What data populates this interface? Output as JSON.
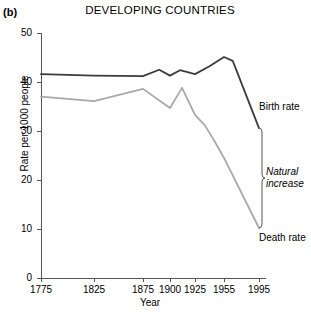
{
  "panel": {
    "label": "(b)"
  },
  "colors": {
    "birth_rate": "#3c3c3c",
    "death_rate": "#a9a9a9",
    "axis": "#555555",
    "text": "#000000",
    "background": "#ffffff"
  },
  "annotations": {
    "birth_rate_label": "Birth rate",
    "natural_increase_label_line1": "Natural",
    "natural_increase_label_line2": "increase",
    "death_rate_label": "Death rate"
  },
  "chart_data": {
    "type": "line",
    "title": "DEVELOPING COUNTRIES",
    "xlabel": "Year",
    "ylabel": "Rate per 1000 people",
    "xlim": [
      1775,
      1995
    ],
    "ylim": [
      0,
      50
    ],
    "yticks": [
      0,
      10,
      20,
      30,
      40,
      50
    ],
    "ytick_labels": [
      "0",
      "10",
      "20",
      "30",
      "40",
      "50"
    ],
    "xticks": [
      1775,
      1825,
      1875,
      1900,
      1925,
      1955,
      1995
    ],
    "xtick_labels": [
      "1775",
      "1825",
      "1875",
      "1900",
      "1925",
      "1955",
      "1995"
    ],
    "grid": false,
    "legend_position": "right-inline",
    "series": [
      {
        "name": "Birth rate",
        "color": "#3c3c3c",
        "x": [
          1775,
          1825,
          1875,
          1890,
          1900,
          1910,
          1925,
          1940,
          1955,
          1965,
          1995
        ],
        "values": [
          41.6,
          41.3,
          41.2,
          42.5,
          41.3,
          42.4,
          41.6,
          43.2,
          45.1,
          44.3,
          30.6
        ]
      },
      {
        "name": "Death rate",
        "color": "#a9a9a9",
        "x": [
          1775,
          1825,
          1875,
          1900,
          1912,
          1925,
          1935,
          1945,
          1955,
          1995
        ],
        "values": [
          37.0,
          36.1,
          38.6,
          34.7,
          38.8,
          33.3,
          31.2,
          28.0,
          24.5,
          10.2
        ]
      }
    ],
    "natural_increase_bracket": {
      "label": "Natural increase",
      "year": 1995,
      "upper": 30.6,
      "lower": 10.2
    }
  }
}
